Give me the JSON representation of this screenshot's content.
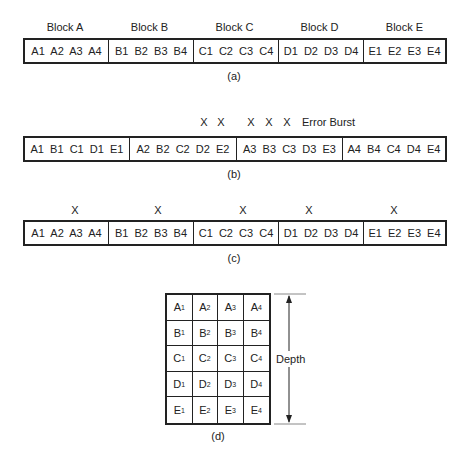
{
  "panel_a": {
    "caption": "(a)",
    "headers": [
      "Block A",
      "Block B",
      "Block C",
      "Block D",
      "Block E"
    ],
    "segments": [
      "A1  A2  A3  A4",
      "B1  B2  B3  B4",
      "C1  C2  C3  C4",
      "D1  D2  D3  D4",
      "E1  E2  E3  E4"
    ]
  },
  "panel_b": {
    "caption": "(b)",
    "segments": [
      "A1  B1  C1  D1  E1",
      "A2  B2  C2  D2  E2",
      "A3  B3  C3  D3  E3",
      "A4  B4  C4  D4  E4"
    ],
    "marks": [
      "X",
      "X",
      "X",
      "X",
      "X"
    ],
    "burst_label": "Error Burst"
  },
  "panel_c": {
    "caption": "(c)",
    "segments": [
      "A1  A2  A3  A4",
      "B1  B2  B3  B4",
      "C1  C2  C3  C4",
      "D1  D2  D3  D4",
      "E1  E2  E3  E4"
    ],
    "marks": [
      "X",
      "X",
      "X",
      "X",
      "X"
    ]
  },
  "panel_d": {
    "caption": "(d)",
    "depth_label": "Depth",
    "rows": [
      [
        {
          "l": "A",
          "s": "1"
        },
        {
          "l": "A",
          "s": "2"
        },
        {
          "l": "A",
          "s": "3"
        },
        {
          "l": "A",
          "s": "4"
        }
      ],
      [
        {
          "l": "B",
          "s": "1"
        },
        {
          "l": "B",
          "s": "2"
        },
        {
          "l": "B",
          "s": "3"
        },
        {
          "l": "B",
          "s": "4"
        }
      ],
      [
        {
          "l": "C",
          "s": "1"
        },
        {
          "l": "C",
          "s": "2"
        },
        {
          "l": "C",
          "s": "3"
        },
        {
          "l": "C",
          "s": "4"
        }
      ],
      [
        {
          "l": "D",
          "s": "1"
        },
        {
          "l": "D",
          "s": "2"
        },
        {
          "l": "D",
          "s": "3"
        },
        {
          "l": "D",
          "s": "4"
        }
      ],
      [
        {
          "l": "E",
          "s": "1"
        },
        {
          "l": "E",
          "s": "2"
        },
        {
          "l": "E",
          "s": "3"
        },
        {
          "l": "E",
          "s": "4"
        }
      ]
    ]
  }
}
